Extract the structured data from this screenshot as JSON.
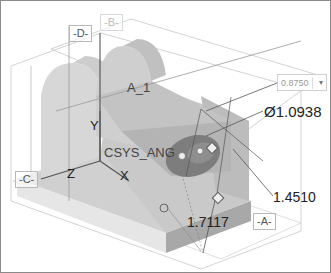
{
  "viewport": {
    "datums": {
      "planes": [
        "-D-",
        "-B-",
        "-C-",
        "-A-"
      ],
      "axis": "A_1",
      "csys": "CSYS_ANG",
      "csys_axes": [
        "X",
        "Y",
        "Z"
      ]
    },
    "dimensions": {
      "active_input_value": "0.8750",
      "diameter": "Ø1.0938",
      "height": "1.4510",
      "offset": "1.7117"
    },
    "icons": [
      "dropdown-arrow-icon",
      "drag-handle-icon"
    ],
    "colors": {
      "model_light": "#d9d9d9",
      "model_mid": "#c4c4c4",
      "model_dark": "#a9a9a9",
      "hole": "#7d7d7d",
      "datum_line": "#b0b0b0",
      "dimension_line": "#555555"
    }
  }
}
